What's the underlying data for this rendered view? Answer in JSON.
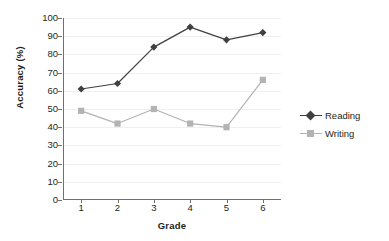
{
  "chart_data": {
    "type": "line",
    "title": "",
    "subtitle": "",
    "xlabel": "Grade",
    "ylabel": "Accuracy (%)",
    "categories": [
      "1",
      "2",
      "3",
      "4",
      "5",
      "6"
    ],
    "series": [
      {
        "name": "Reading",
        "values": [
          61,
          64,
          84,
          95,
          88,
          92
        ],
        "color": "#404040",
        "marker": "diamond"
      },
      {
        "name": "Writing",
        "values": [
          49,
          42,
          50,
          42,
          40,
          66
        ],
        "color": "#b3b3b3",
        "marker": "square"
      }
    ],
    "ylim": [
      0,
      100
    ],
    "ytick_step": 10,
    "yticks": [
      "0",
      "10",
      "20",
      "30",
      "40",
      "50",
      "60",
      "70",
      "80",
      "90",
      "100"
    ],
    "grid": true,
    "grid_axis": "y",
    "legend_position": "right",
    "axis_color": "#6f6f6f",
    "gridline_color": "#f0f0f2",
    "background": "#ffffff"
  },
  "axes": {
    "x_title": "Grade",
    "y_title": "Accuracy (%)"
  },
  "legend": {
    "entries": [
      {
        "label": "Reading"
      },
      {
        "label": "Writing"
      }
    ]
  }
}
